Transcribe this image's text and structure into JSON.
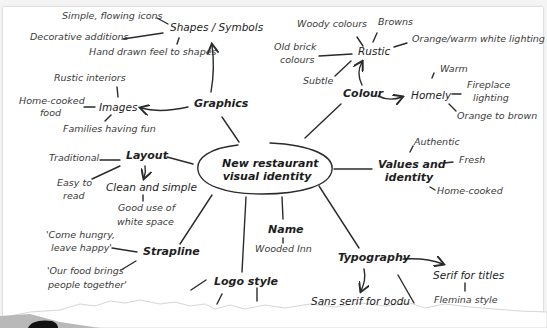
{
  "diagram": {
    "type": "mind-map",
    "center": {
      "line1": "New restaurant",
      "line2": "visual identity"
    },
    "branches": {
      "graphics": {
        "label": "Graphics",
        "shapes": {
          "label": "Shapes / Symbols",
          "leaves": [
            "Simple, flowing icons",
            "Decorative additions",
            "Hand drawn feel to shapes"
          ]
        },
        "images": {
          "label": "Images",
          "leaves": [
            "Rustic interiors",
            "Home-cooked",
            "food",
            "Families having fun"
          ]
        }
      },
      "colour": {
        "label": "Colour",
        "rustic": {
          "label": "Rustic",
          "leaves": [
            "Woody colours",
            "Browns",
            "Orange/warm white lighting",
            "Old brick",
            "colours",
            "Subtle"
          ]
        },
        "homely": {
          "label": "Homely",
          "leaves": [
            "Warm",
            "Fireplace",
            "lighting",
            "Orange to brown"
          ]
        }
      },
      "values": {
        "line1": "Values and",
        "line2": "identity",
        "leaves": [
          "Authentic",
          "Fresh",
          "Home-cooked"
        ]
      },
      "layout": {
        "label": "Layout",
        "leaves": [
          "Traditional",
          "Easy to",
          "read"
        ],
        "clean": {
          "label": "Clean and simple",
          "leaves": [
            "Good use of",
            "white space"
          ]
        }
      },
      "strapline": {
        "label": "Strapline",
        "leaves": [
          "'Come hungry,",
          "leave happy'",
          "'Our food brings",
          "people together'"
        ]
      },
      "name": {
        "label": "Name",
        "leaves": [
          "Wooded Inn"
        ]
      },
      "logo": {
        "label": "Logo style"
      },
      "typography": {
        "label": "Typography",
        "serif": {
          "label": "Serif for titles",
          "leaves": [
            "Flemina style"
          ]
        },
        "sans": {
          "label": "Sans serif for bodu"
        }
      }
    }
  }
}
